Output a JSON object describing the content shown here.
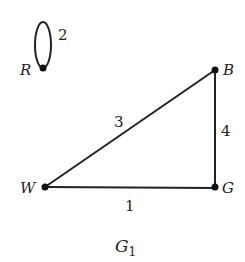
{
  "graph": {
    "name": "G",
    "name_subscript": "1",
    "nodes": [
      {
        "id": "R",
        "label": "R",
        "x": 43,
        "y": 68
      },
      {
        "id": "B",
        "label": "B",
        "x": 215,
        "y": 70
      },
      {
        "id": "W",
        "label": "W",
        "x": 45,
        "y": 187
      },
      {
        "id": "G",
        "label": "G",
        "x": 215,
        "y": 187
      }
    ],
    "edges": [
      {
        "from": "R",
        "to": "R",
        "weight": "2",
        "type": "loop"
      },
      {
        "from": "W",
        "to": "B",
        "weight": "3"
      },
      {
        "from": "B",
        "to": "G",
        "weight": "4"
      },
      {
        "from": "W",
        "to": "G",
        "weight": "1"
      }
    ]
  }
}
